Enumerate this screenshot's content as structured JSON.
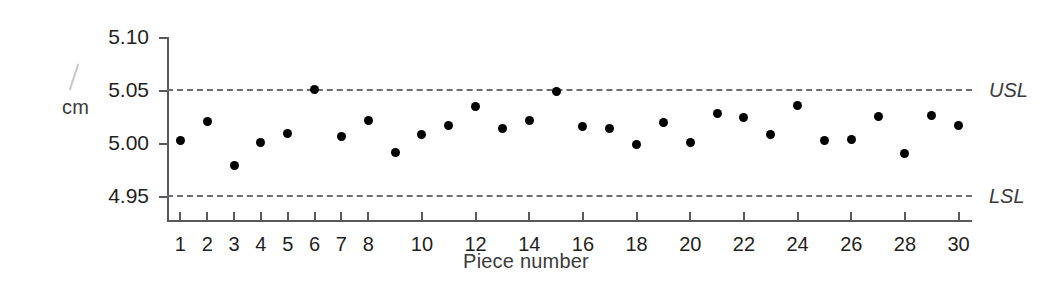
{
  "chart_data": {
    "type": "scatter",
    "title": "",
    "subtitle": "",
    "xlabel": "Piece number",
    "ylabel": "cm",
    "ylabel_unit": "cm",
    "xlim": [
      0.5,
      30.5
    ],
    "ylim": [
      4.925,
      5.1
    ],
    "grid": false,
    "legend": null,
    "y_ticks": [
      "5.10",
      "5.05",
      "5.00",
      "4.95"
    ],
    "y_tick_values": [
      5.1,
      5.05,
      5.0,
      4.95
    ],
    "x_ticks": [
      "1",
      "2",
      "3",
      "4",
      "5",
      "6",
      "7",
      "8",
      "10",
      "12",
      "14",
      "16",
      "18",
      "20",
      "22",
      "24",
      "26",
      "28",
      "30"
    ],
    "x_tick_values": [
      1,
      2,
      3,
      4,
      5,
      6,
      7,
      8,
      10,
      12,
      14,
      16,
      18,
      20,
      22,
      24,
      26,
      28,
      30
    ],
    "x": [
      1,
      2,
      3,
      4,
      5,
      6,
      7,
      8,
      9,
      10,
      11,
      12,
      13,
      14,
      15,
      16,
      17,
      18,
      19,
      20,
      21,
      22,
      23,
      24,
      25,
      26,
      27,
      28,
      29,
      30
    ],
    "values": [
      5.002,
      5.02,
      4.978,
      5.0,
      5.009,
      5.05,
      5.006,
      5.021,
      4.991,
      5.008,
      5.016,
      5.034,
      5.013,
      5.021,
      5.048,
      5.015,
      5.013,
      4.998,
      5.019,
      5.0,
      5.028,
      5.024,
      5.008,
      5.035,
      5.002,
      5.003,
      5.025,
      4.99,
      5.026,
      5.016
    ],
    "annotations": [
      {
        "name": "USL",
        "label": "USL",
        "value": 5.05,
        "style": "dashed"
      },
      {
        "name": "LSL",
        "label": "LSL",
        "value": 4.95,
        "style": "dashed"
      }
    ],
    "colors": {
      "point": "#000000",
      "axis": "#58595b",
      "spec_line": "#6d6e71",
      "text": "#231f20",
      "background": "#ffffff"
    }
  }
}
